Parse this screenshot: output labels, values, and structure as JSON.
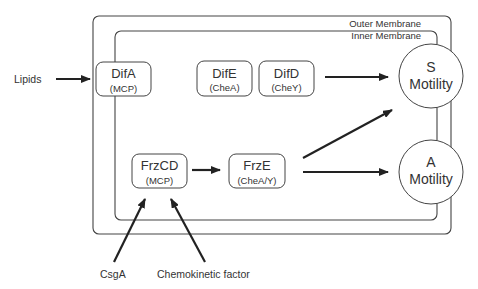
{
  "membranes": {
    "outer_label": "Outer Membrane",
    "inner_label": "Inner Membrane"
  },
  "inputs": {
    "lipids": "Lipids",
    "csga": "CsgA",
    "chemokinetic": "Chemokinetic factor"
  },
  "proteins": [
    {
      "name": "DifA",
      "role": "(MCP)"
    },
    {
      "name": "DifE",
      "role": "(CheA)"
    },
    {
      "name": "DifD",
      "role": "(CheY)"
    },
    {
      "name": "FrzCD",
      "role": "(MCP)"
    },
    {
      "name": "FrzE",
      "role": "(CheA/Y)"
    }
  ],
  "outputs": [
    {
      "letter": "S",
      "label": "Motility"
    },
    {
      "letter": "A",
      "label": "Motility"
    }
  ],
  "colors": {
    "stroke": "#444444",
    "text": "#333333",
    "background": "#ffffff"
  }
}
